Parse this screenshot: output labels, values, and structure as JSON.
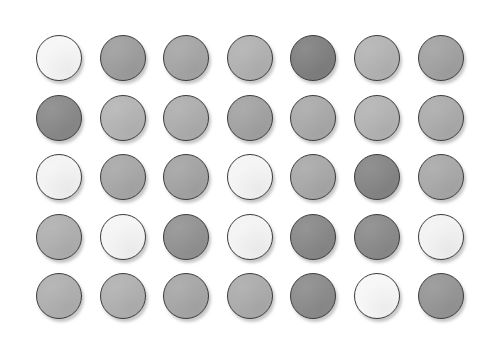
{
  "canvas": {
    "width": 500,
    "height": 351,
    "background_color": "#ffffff",
    "title": "grayscale-circle-swatch-grid"
  },
  "grid": {
    "rows": 5,
    "columns": 7,
    "circle_diameter_px": 46,
    "column_spacing_px": 63.6,
    "row_spacing_px": 59.6,
    "origin_x_px": 36,
    "origin_y_px": 35,
    "outline_color": "#3c3c3c",
    "outline_width_px": 1.4,
    "shadow_color": "#787878"
  },
  "swatches": [
    [
      {
        "name": "r1c1",
        "color": "#f6f6f6",
        "gray_value": 246
      },
      {
        "name": "r1c2",
        "color": "#9e9e9e",
        "gray_value": 158
      },
      {
        "name": "r1c3",
        "color": "#a6a6a6",
        "gray_value": 166
      },
      {
        "name": "r1c4",
        "color": "#b2b2b2",
        "gray_value": 178
      },
      {
        "name": "r1c5",
        "color": "#808080",
        "gray_value": 128
      },
      {
        "name": "r1c6",
        "color": "#b4b4b4",
        "gray_value": 180
      },
      {
        "name": "r1c7",
        "color": "#a2a2a2",
        "gray_value": 162
      }
    ],
    [
      {
        "name": "r2c1",
        "color": "#8a8a8a",
        "gray_value": 138
      },
      {
        "name": "r2c2",
        "color": "#b5b5b5",
        "gray_value": 181
      },
      {
        "name": "r2c3",
        "color": "#aeaeae",
        "gray_value": 174
      },
      {
        "name": "r2c4",
        "color": "#a3a3a3",
        "gray_value": 163
      },
      {
        "name": "r2c5",
        "color": "#aaaaaa",
        "gray_value": 170
      },
      {
        "name": "r2c6",
        "color": "#b4b4b4",
        "gray_value": 180
      },
      {
        "name": "r2c7",
        "color": "#acacac",
        "gray_value": 172
      }
    ],
    [
      {
        "name": "r3c1",
        "color": "#f4f4f4",
        "gray_value": 244
      },
      {
        "name": "r3c2",
        "color": "#a8a8a8",
        "gray_value": 168
      },
      {
        "name": "r3c3",
        "color": "#a4a4a4",
        "gray_value": 164
      },
      {
        "name": "r3c4",
        "color": "#f5f5f5",
        "gray_value": 245
      },
      {
        "name": "r3c5",
        "color": "#a9a9a9",
        "gray_value": 169
      },
      {
        "name": "r3c6",
        "color": "#868686",
        "gray_value": 134
      },
      {
        "name": "r3c7",
        "color": "#a9a9a9",
        "gray_value": 169
      }
    ],
    [
      {
        "name": "r4c1",
        "color": "#b0b0b0",
        "gray_value": 176
      },
      {
        "name": "r4c2",
        "color": "#f5f5f5",
        "gray_value": 245
      },
      {
        "name": "r4c3",
        "color": "#939393",
        "gray_value": 147
      },
      {
        "name": "r4c4",
        "color": "#f4f4f4",
        "gray_value": 244
      },
      {
        "name": "r4c5",
        "color": "#898989",
        "gray_value": 137
      },
      {
        "name": "r4c6",
        "color": "#8b8b8b",
        "gray_value": 139
      },
      {
        "name": "r4c7",
        "color": "#f3f3f3",
        "gray_value": 243
      }
    ],
    [
      {
        "name": "r5c1",
        "color": "#b0b0b0",
        "gray_value": 176
      },
      {
        "name": "r5c2",
        "color": "#b1b1b1",
        "gray_value": 177
      },
      {
        "name": "r5c3",
        "color": "#a7a7a7",
        "gray_value": 167
      },
      {
        "name": "r5c4",
        "color": "#acacac",
        "gray_value": 172
      },
      {
        "name": "r5c5",
        "color": "#8c8c8c",
        "gray_value": 140
      },
      {
        "name": "r5c6",
        "color": "#f7f7f7",
        "gray_value": 247
      },
      {
        "name": "r5c7",
        "color": "#969696",
        "gray_value": 150
      }
    ]
  ]
}
